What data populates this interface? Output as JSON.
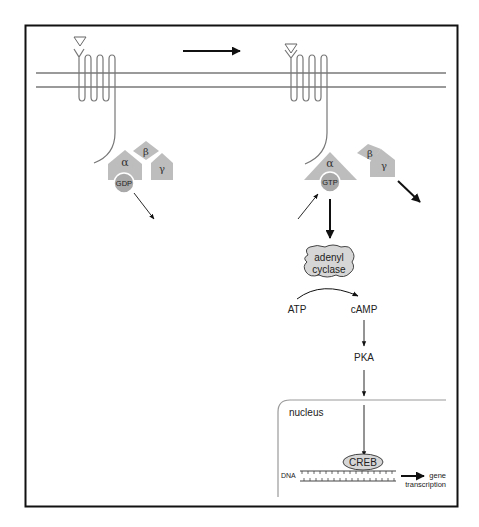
{
  "diagram": {
    "type": "GPCR signaling pathway (cAMP / PKA / CREB)",
    "colors": {
      "frame": "#111111",
      "membrane": "#9a9a9a",
      "protein_fill": "#bdbdbd",
      "nucleotide_fill": "#a9a9a9",
      "enzyme_fill": "#d6d6d6",
      "nucleus_line": "#9a9a9a",
      "arrow": "#111111"
    },
    "left_state": {
      "alpha_label": "α",
      "beta_label": "β",
      "gamma_label": "γ",
      "nucleotide_label": "GDP"
    },
    "right_state": {
      "alpha_label": "α",
      "beta_label": "β",
      "gamma_label": "γ",
      "nucleotide_label": "GTP"
    },
    "pathway": {
      "enzyme_line1": "adenyl",
      "enzyme_line2": "cyclase",
      "substrate": "ATP",
      "product": "cAMP",
      "kinase": "PKA"
    },
    "nucleus": {
      "label": "nucleus",
      "dna_label": "DNA",
      "factor_label": "CREB",
      "output_line1": "gene",
      "output_line2": "transcription"
    }
  }
}
